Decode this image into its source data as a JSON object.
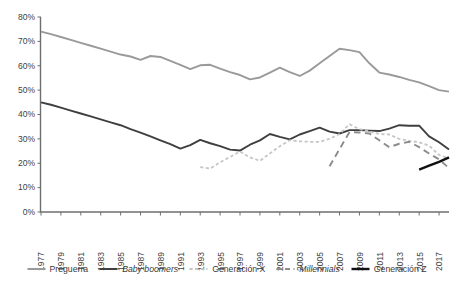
{
  "chart_data": {
    "type": "line",
    "title": "",
    "subtitle": "",
    "xlabel": "",
    "ylabel": "",
    "xlim": [
      1977,
      2018
    ],
    "ylim": [
      0,
      80
    ],
    "grid": false,
    "legend_position": "bottom",
    "y_ticks": [
      "0%",
      "10%",
      "20%",
      "30%",
      "40%",
      "50%",
      "60%",
      "70%",
      "80%"
    ],
    "y_tick_values": [
      0,
      10,
      20,
      30,
      40,
      50,
      60,
      70,
      80
    ],
    "x_tick_labels": [
      "1977",
      "1979",
      "1981",
      "1983",
      "1985",
      "1987",
      "1989",
      "1991",
      "1993",
      "1995",
      "1997",
      "1999",
      "2001",
      "2003",
      "2005",
      "2007",
      "2009",
      "2011",
      "2013",
      "2015",
      "2017"
    ],
    "x_tick_values": [
      1977,
      1979,
      1981,
      1983,
      1985,
      1987,
      1989,
      1991,
      1993,
      1995,
      1997,
      1999,
      2001,
      2003,
      2005,
      2007,
      2009,
      2011,
      2013,
      2015,
      2017
    ],
    "series": [
      {
        "name": "Preguerra",
        "color": "#9a9a9a",
        "style": "solid",
        "width": 1.9,
        "italic": false,
        "x": [
          1977,
          1978,
          1979,
          1980,
          1981,
          1982,
          1983,
          1984,
          1985,
          1986,
          1987,
          1988,
          1989,
          1990,
          1991,
          1992,
          1993,
          1994,
          1995,
          1996,
          1997,
          1998,
          1999,
          2000,
          2001,
          2002,
          2003,
          2004,
          2005,
          2006,
          2007,
          2008,
          2009,
          2010,
          2011,
          2012,
          2013,
          2014,
          2015,
          2016,
          2017,
          2018
        ],
        "values": [
          74.0,
          73.0,
          71.8,
          70.6,
          69.4,
          68.2,
          67.0,
          65.8,
          64.6,
          63.8,
          62.4,
          64.0,
          63.6,
          62.0,
          60.4,
          58.6,
          60.2,
          60.4,
          58.8,
          57.4,
          56.2,
          54.4,
          55.2,
          57.2,
          59.2,
          57.4,
          55.8,
          58.0,
          61.0,
          64.0,
          67.0,
          66.4,
          65.6,
          61.0,
          57.2,
          56.4,
          55.4,
          54.2,
          53.2,
          51.6,
          50.0,
          49.4
        ]
      },
      {
        "name": "Baby boomers",
        "color": "#3f3f3f",
        "style": "solid",
        "width": 1.9,
        "italic": true,
        "x": [
          1977,
          1978,
          1979,
          1980,
          1981,
          1982,
          1983,
          1984,
          1985,
          1986,
          1987,
          1988,
          1989,
          1990,
          1991,
          1992,
          1993,
          1994,
          1995,
          1996,
          1997,
          1998,
          1999,
          2000,
          2001,
          2002,
          2003,
          2004,
          2005,
          2006,
          2007,
          2008,
          2009,
          2010,
          2011,
          2012,
          2013,
          2014,
          2015,
          2016,
          2017,
          2018
        ],
        "values": [
          45.0,
          44.0,
          42.8,
          41.6,
          40.4,
          39.2,
          38.0,
          36.8,
          35.6,
          34.0,
          32.6,
          31.0,
          29.4,
          27.8,
          26.0,
          27.4,
          29.6,
          28.2,
          27.0,
          25.6,
          25.2,
          27.6,
          29.4,
          32.0,
          30.8,
          29.8,
          31.8,
          33.2,
          34.6,
          33.0,
          32.2,
          33.6,
          33.6,
          33.4,
          33.2,
          34.2,
          35.6,
          35.4,
          35.4,
          31.0,
          28.6,
          25.6
        ]
      },
      {
        "name": "Generación X",
        "color": "#c6c6c6",
        "style": "dotted",
        "width": 1.8,
        "italic": false,
        "x": [
          1993,
          1994,
          1995,
          1996,
          1997,
          1998,
          1999,
          2000,
          2001,
          2002,
          2003,
          2004,
          2005,
          2006,
          2007,
          2008,
          2009,
          2010,
          2011,
          2012,
          2013,
          2014,
          2015,
          2016,
          2017,
          2018
        ],
        "values": [
          18.4,
          17.8,
          20.4,
          22.6,
          24.8,
          22.4,
          21.0,
          24.0,
          27.0,
          29.4,
          29.0,
          28.8,
          28.8,
          30.0,
          32.0,
          36.0,
          34.0,
          33.0,
          32.0,
          31.8,
          30.0,
          29.2,
          28.6,
          27.2,
          23.4,
          22.0
        ]
      },
      {
        "name": "Millennials",
        "color": "#8c8c8c",
        "style": "dashed",
        "width": 1.9,
        "italic": true,
        "x": [
          2006,
          2007,
          2008,
          2009,
          2010,
          2011,
          2012,
          2013,
          2014,
          2015,
          2016,
          2017,
          2018
        ],
        "values": [
          18.8,
          25.8,
          32.8,
          32.6,
          32.2,
          29.4,
          26.6,
          28.0,
          28.8,
          26.6,
          24.0,
          21.6,
          18.0
        ]
      },
      {
        "name": "Generación Z",
        "color": "#111111",
        "style": "solid",
        "width": 2.4,
        "italic": false,
        "x": [
          2015,
          2016,
          2017,
          2018
        ],
        "values": [
          17.4,
          19.0,
          20.6,
          22.4
        ]
      }
    ]
  }
}
